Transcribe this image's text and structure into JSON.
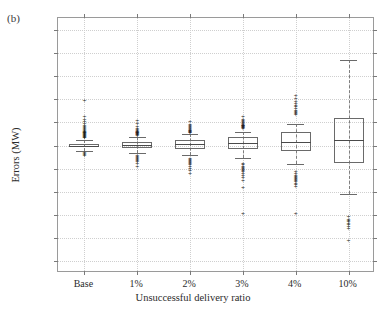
{
  "figure": {
    "panel_label": "(b)"
  },
  "chart_data": {
    "type": "box",
    "title": "",
    "xlabel": "Unsuccessful delivery ratio",
    "ylabel": "Errors (MW)",
    "categories": [
      "Base",
      "1%",
      "2%",
      "3%",
      "4%",
      "10%"
    ],
    "ylim": [
      -0.275,
      0.275
    ],
    "yticks": [
      0.25,
      0.2,
      0.15,
      0.1,
      0.05,
      0,
      -0.05,
      -0.1,
      -0.15,
      -0.2,
      -0.25
    ],
    "ytick_labels": [
      "0.25",
      "0.2",
      "0.15",
      "0.1",
      "0.05",
      "0",
      "-0.05",
      "-0.1",
      "-0.15",
      "-0.2",
      "-0.25"
    ],
    "grid": true,
    "legend": "none",
    "series": [
      {
        "name": "Base",
        "q1": -0.004,
        "median": 0.0,
        "q3": 0.004,
        "whisker_low": -0.012,
        "whisker_high": 0.012,
        "outliers": [
          0.095,
          0.062,
          0.055,
          0.05,
          0.046,
          0.042,
          0.04,
          0.038,
          0.036,
          0.034,
          0.032,
          0.03,
          0.029,
          0.028,
          0.027,
          0.026,
          0.025,
          0.024,
          0.023,
          0.022,
          0.021,
          0.02,
          0.019,
          0.018,
          0.017,
          0.016,
          -0.016,
          -0.018,
          -0.02,
          -0.022
        ]
      },
      {
        "name": "1%",
        "q1": -0.006,
        "median": 0.002,
        "q3": 0.008,
        "whisker_low": -0.016,
        "whisker_high": 0.018,
        "outliers": [
          0.052,
          0.046,
          0.04,
          0.036,
          0.033,
          0.031,
          0.03,
          0.029,
          0.028,
          0.027,
          0.026,
          0.025,
          0.024,
          0.023,
          0.022,
          0.021,
          -0.023,
          -0.025,
          -0.027,
          -0.029,
          -0.031,
          -0.033,
          -0.036,
          -0.04,
          -0.046
        ]
      },
      {
        "name": "2%",
        "q1": -0.008,
        "median": 0.003,
        "q3": 0.012,
        "whisker_low": -0.02,
        "whisker_high": 0.024,
        "outliers": [
          0.05,
          0.045,
          0.042,
          0.04,
          0.038,
          0.036,
          0.034,
          0.032,
          0.031,
          0.03,
          0.029,
          0.028,
          0.027,
          -0.03,
          -0.032,
          -0.034,
          -0.036,
          -0.038,
          -0.04,
          -0.042,
          -0.046,
          -0.05,
          -0.055,
          -0.062
        ]
      },
      {
        "name": "3%",
        "q1": -0.007,
        "median": 0.006,
        "q3": 0.019,
        "whisker_low": -0.026,
        "whisker_high": 0.03,
        "outliers": [
          0.062,
          0.056,
          0.052,
          0.05,
          0.048,
          0.046,
          0.044,
          0.043,
          0.042,
          0.041,
          0.04,
          0.039,
          0.038,
          0.037,
          0.036,
          -0.04,
          -0.043,
          -0.046,
          -0.048,
          -0.05,
          -0.052,
          -0.055,
          -0.058,
          -0.062,
          -0.066,
          -0.07,
          -0.076,
          -0.092,
          -0.147
        ]
      },
      {
        "name": "4%",
        "q1": -0.012,
        "median": 0.008,
        "q3": 0.03,
        "whisker_low": -0.04,
        "whisker_high": 0.046,
        "outliers": [
          0.107,
          0.1,
          0.094,
          0.09,
          0.086,
          0.082,
          0.078,
          0.075,
          0.072,
          0.07,
          0.068,
          0.066,
          -0.058,
          -0.062,
          -0.065,
          -0.068,
          -0.07,
          -0.072,
          -0.074,
          -0.076,
          -0.079,
          -0.082,
          -0.086,
          -0.09,
          -0.147
        ]
      },
      {
        "name": "10%",
        "q1": -0.038,
        "median": 0.012,
        "q3": 0.06,
        "whisker_low": -0.105,
        "whisker_high": 0.185,
        "outliers": [
          -0.155,
          -0.16,
          -0.163,
          -0.166,
          -0.169,
          -0.172,
          -0.176,
          -0.18,
          -0.207
        ]
      }
    ]
  }
}
